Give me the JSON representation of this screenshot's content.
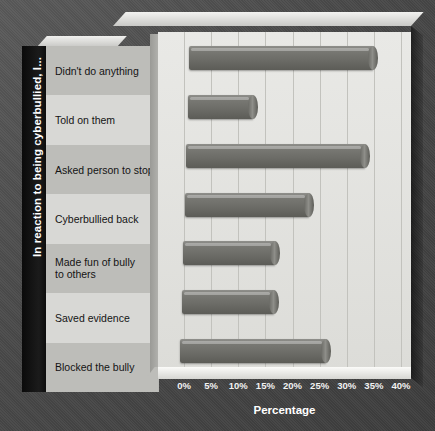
{
  "chart_data": {
    "type": "bar",
    "orientation": "horizontal",
    "title": "",
    "xlabel": "Percentage",
    "ylabel": "In reaction to being cyberbullied, I...",
    "categories": [
      "Didn't do anything",
      "Told on them",
      "Asked person to stop",
      "Cyberbullied back",
      "Made fun of bully to others",
      "Saved evidence",
      "Blocked the bully"
    ],
    "values": [
      34,
      12,
      33,
      23,
      17,
      17,
      27
    ],
    "value_unit": "%",
    "xlim": [
      0,
      40
    ],
    "xticks": [
      0,
      5,
      10,
      15,
      20,
      25,
      30,
      35,
      40
    ],
    "xtick_labels": [
      "0%",
      "5%",
      "10%",
      "15%",
      "20%",
      "25%",
      "30%",
      "35%",
      "40%"
    ],
    "grid": "vertical",
    "legend": "none",
    "style": "3d-cylinder-bars",
    "colors": {
      "bar": "#6d6d68",
      "plot_background": "#e4e4e0",
      "frame_background": "#4a4a4a",
      "axis_title_text": "#ffffff",
      "category_text": "#141414",
      "gridline": "#c2c2bd"
    }
  },
  "labels": {
    "category_lines": [
      [
        "Didn't do anything"
      ],
      [
        "Told on them"
      ],
      [
        "Asked person to stop"
      ],
      [
        "Cyberbullied back"
      ],
      [
        "Made fun of bully",
        "to others"
      ],
      [
        "Saved evidence"
      ],
      [
        "Blocked the bully"
      ]
    ]
  }
}
